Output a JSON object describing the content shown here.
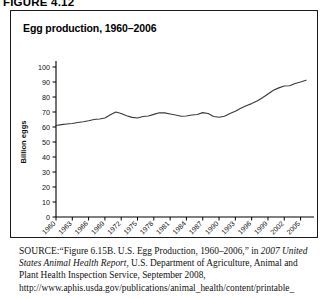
{
  "figure": {
    "label": "FIGURE 4.12"
  },
  "chart_box": {
    "title": "Egg production, 1960–2006"
  },
  "source": {
    "label": "SOURCE:",
    "text_part1": "“Figure 6.15B. U.S. Egg Production, 1960–2006,” in ",
    "italic1": "2007 United States Animal Health Report",
    "text_part2": ", U.S. Department of Agriculture, Animal and Plant Health Inspection Service, September 2008, http://www.aphis.usda.gov/publications/animal_health/content/printable_"
  },
  "chart_data": {
    "type": "line",
    "title": "Egg production, 1960–2006",
    "xlabel": "",
    "ylabel": "Billion eggs",
    "xlim": [
      1960,
      2006
    ],
    "ylim": [
      0,
      100
    ],
    "yticks": [
      0,
      10,
      20,
      30,
      40,
      50,
      60,
      70,
      80,
      90,
      100
    ],
    "xticks": [
      1960,
      1963,
      1966,
      1969,
      1972,
      1975,
      1978,
      1981,
      1984,
      1987,
      1990,
      1993,
      1996,
      1999,
      2002,
      2005
    ],
    "grid": false,
    "legend": null,
    "line_color": "#3a3a3a",
    "series": [
      {
        "name": "Egg production",
        "units": "Billion eggs",
        "x": [
          1960,
          1961,
          1962,
          1963,
          1964,
          1965,
          1966,
          1967,
          1968,
          1969,
          1970,
          1971,
          1972,
          1973,
          1974,
          1975,
          1976,
          1977,
          1978,
          1979,
          1980,
          1981,
          1982,
          1983,
          1984,
          1985,
          1986,
          1987,
          1988,
          1989,
          1990,
          1991,
          1992,
          1993,
          1994,
          1995,
          1996,
          1997,
          1998,
          1999,
          2000,
          2001,
          2002,
          2003,
          2004,
          2005,
          2006
        ],
        "values": [
          61.0,
          61.6,
          62.0,
          62.3,
          63.0,
          63.5,
          64.2,
          65.0,
          65.3,
          66.0,
          68.2,
          70.0,
          69.0,
          67.5,
          66.4,
          66.0,
          67.0,
          67.3,
          68.4,
          69.5,
          69.4,
          68.7,
          68.0,
          67.2,
          67.3,
          68.0,
          68.3,
          69.6,
          69.0,
          67.0,
          66.5,
          67.2,
          69.0,
          70.5,
          72.5,
          74.2,
          75.6,
          77.3,
          79.5,
          82.0,
          84.5,
          86.1,
          87.3,
          87.5,
          89.0,
          90.0,
          91.2
        ]
      }
    ]
  }
}
